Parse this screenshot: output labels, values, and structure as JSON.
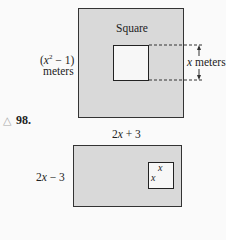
{
  "figure_top": {
    "square_label": "Square",
    "side_label_line1": "(x² − 1)",
    "side_label_line2": "meters",
    "inner_label": "x meters"
  },
  "figure_bottom": {
    "problem_marker": "△",
    "problem_number": "98.",
    "top_label": "2x + 3",
    "left_label": "2x − 3",
    "inner_top_label": "x",
    "inner_left_label": "x"
  },
  "colors": {
    "shaded": "#d9d9d9",
    "inner": "#f7f7f7",
    "line": "#333333"
  }
}
